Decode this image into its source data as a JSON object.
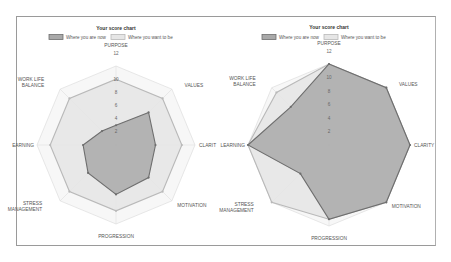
{
  "chart_data": [
    {
      "type": "radar",
      "title": "Your score chart",
      "legend": [
        "Where you are now",
        "Where you want to be"
      ],
      "axes": [
        "PURPOSE",
        "VALUES",
        "CLARITY",
        "MOTIVATION",
        "PROGRESSION",
        "STRESS MANAGEMENT",
        "LEARNING",
        "WORK LIFE BALANCE"
      ],
      "axis_labels_display": [
        "PURPOSE",
        "VALUES",
        "CLARIT",
        "MOTIVATION",
        "PROGRESSION",
        "STRESS|MANAGEMENT",
        "EARNING",
        "WORK LIFE|BALANCE"
      ],
      "ticks": [
        2,
        4,
        6,
        8,
        10,
        12
      ],
      "rmax": 12,
      "series": [
        {
          "name": "Where you are now",
          "values": [
            3,
            7,
            6,
            7,
            7.5,
            6,
            5,
            3
          ]
        },
        {
          "name": "Where you want to be",
          "values": [
            10,
            10,
            10,
            10,
            10,
            10,
            10,
            10
          ]
        }
      ]
    },
    {
      "type": "radar",
      "title": "Your score chart",
      "legend": [
        "Where you are now",
        "Where you want to be"
      ],
      "axes": [
        "PURPOSE",
        "VALUES",
        "CLARITY",
        "MOTIVATION",
        "PROGRESSION",
        "STRESS MANAGEMENT",
        "LEARNING",
        "WORK LIFE BALANCE"
      ],
      "axis_labels_display": [
        "PURPOSE",
        "VALUES",
        "CLARITY",
        "MOTIVATION",
        "PROGRESSION",
        "STRESS|MANAGEMENT",
        "LEARNING",
        "WORK LIFE|BALANCE"
      ],
      "ticks": [
        2,
        4,
        6,
        8,
        10,
        12
      ],
      "rmax": 12,
      "series": [
        {
          "name": "Where you are now",
          "values": [
            12,
            12,
            12,
            12,
            11,
            6,
            12,
            8
          ]
        },
        {
          "name": "Where you want to be",
          "values": [
            12,
            12,
            12,
            12,
            11,
            12,
            12,
            11
          ]
        }
      ]
    }
  ],
  "colors": {
    "now_fill": "#a9a9a9",
    "now_stroke": "#6e6e6e",
    "want_fill": "#e6e6e6",
    "want_stroke": "#b9b9b9",
    "grid": "#d8d8d8",
    "frame": "#9a9a9a"
  }
}
